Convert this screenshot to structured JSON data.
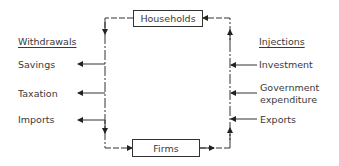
{
  "diagram": {
    "nodes": {
      "households": "Households",
      "firms": "Firms"
    },
    "withdrawals": {
      "heading": "Withdrawals",
      "items": [
        "Savings",
        "Taxation",
        "Imports"
      ]
    },
    "injections": {
      "heading": "Injections",
      "items": [
        "Investment",
        "Government expenditure",
        "Exports"
      ],
      "government_line1": "Government",
      "government_line2": "expenditure"
    },
    "colors": {
      "line": "#333333",
      "text": "#3a3a3a",
      "background": "#ffffff"
    }
  }
}
